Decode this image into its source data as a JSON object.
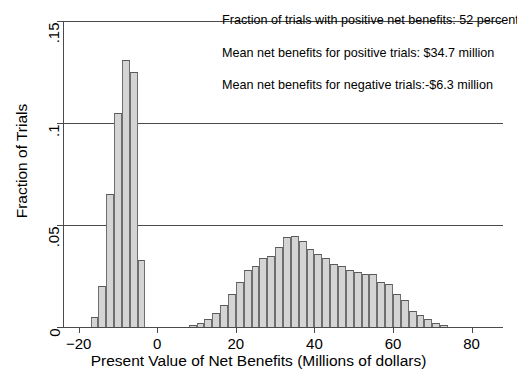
{
  "chart_data": {
    "type": "bar",
    "title": "",
    "subtitle": "",
    "xlabel": "Present Value of Net Benefits (Millions of dollars)",
    "ylabel": "Fraction of Trials",
    "xlim": [
      -24,
      88
    ],
    "ylim": [
      0,
      0.15
    ],
    "xticks": [
      -20,
      0,
      20,
      40,
      60,
      80
    ],
    "xticklabels": [
      "−20",
      "0",
      "20",
      "40",
      "60",
      "80"
    ],
    "yticks": [
      0,
      0.05,
      0.1,
      0.15
    ],
    "yticklabels": [
      "0",
      ".05",
      ".1",
      ".15"
    ],
    "grid": "horizontal",
    "legend": "none",
    "bar_fill": "#d4d4d4",
    "bar_edge": "#6e6e6e",
    "bin_width": 2,
    "categories": [
      -16,
      -14,
      -12,
      -10,
      -8,
      -6,
      -4,
      9,
      11,
      13,
      15,
      17,
      19,
      21,
      23,
      25,
      27,
      29,
      31,
      33,
      35,
      37,
      39,
      41,
      43,
      45,
      47,
      49,
      51,
      53,
      55,
      57,
      59,
      61,
      63,
      65,
      67,
      69,
      71,
      73
    ],
    "values": [
      0.005,
      0.02,
      0.065,
      0.105,
      0.131,
      0.125,
      0.033,
      0.001,
      0.002,
      0.004,
      0.007,
      0.011,
      0.016,
      0.022,
      0.028,
      0.03,
      0.034,
      0.035,
      0.039,
      0.044,
      0.0445,
      0.042,
      0.038,
      0.036,
      0.034,
      0.031,
      0.03,
      0.028,
      0.027,
      0.026,
      0.026,
      0.022,
      0.021,
      0.016,
      0.013,
      0.008,
      0.006,
      0.004,
      0.002,
      0.001
    ],
    "annotations": [
      "Fraction of trials with positive net benefits: 52 percent",
      "Mean net benefits for positive trials: $34.7 million",
      "Mean net benefits for negative trials:-$6.3 million"
    ]
  }
}
